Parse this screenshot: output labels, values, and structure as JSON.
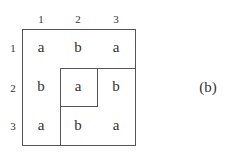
{
  "grid": {
    "col_labels": [
      "1",
      "2",
      "3"
    ],
    "row_labels": [
      "1",
      "2",
      "3"
    ],
    "cells": [
      [
        "a",
        "b",
        "a"
      ],
      [
        "b",
        "a",
        "b"
      ],
      [
        "a",
        "b",
        "a"
      ]
    ]
  },
  "caption": "(b)"
}
